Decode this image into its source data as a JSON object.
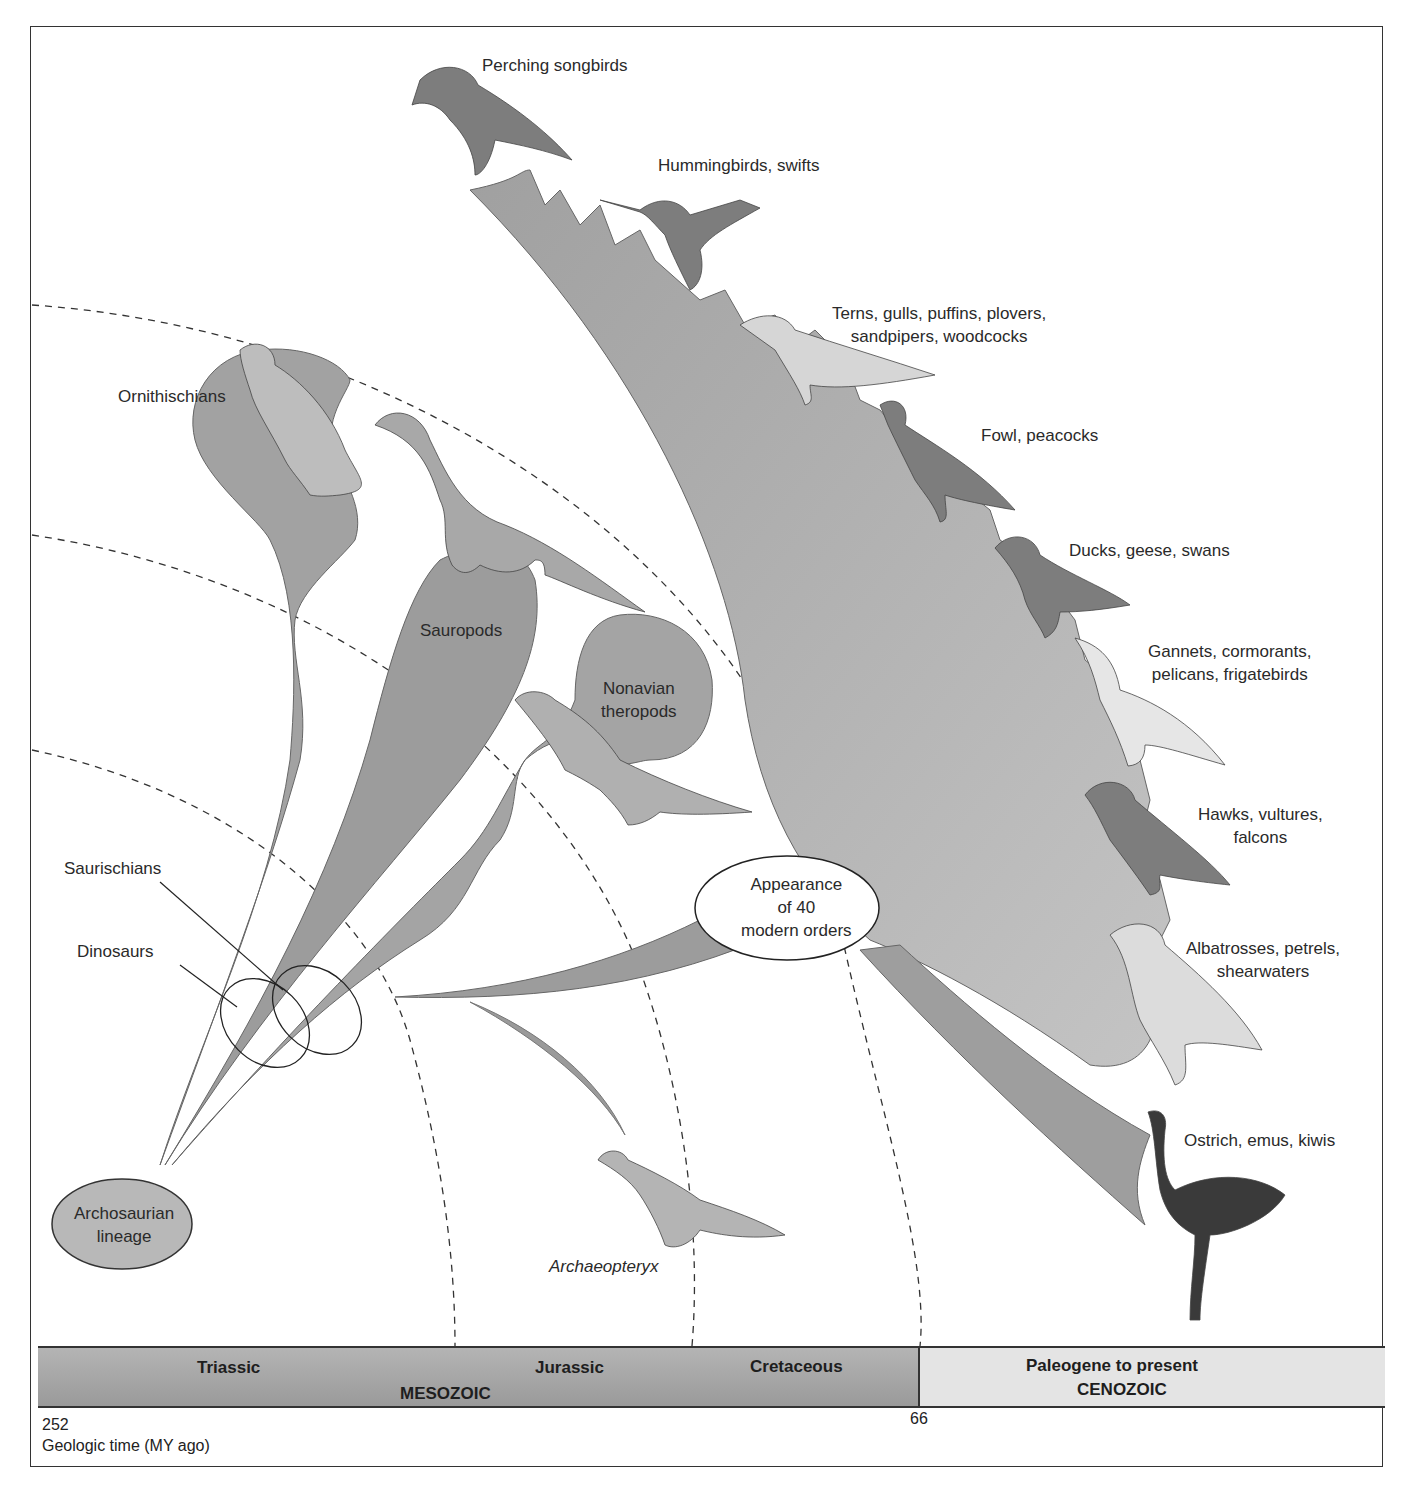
{
  "figure": {
    "colors": {
      "clade_fill": "#9e9e9e",
      "clade_fill_light": "#c2c2c2",
      "mesozoic_bar": "#a8a8a8",
      "cenozoic_bar": "#e4e4e4",
      "frame": "#333333"
    }
  },
  "clades": {
    "archosaurian": "Archosaurian\nlineage",
    "archosaurian_line1": "Archosaurian",
    "archosaurian_line2": "lineage",
    "saurischians": "Saurischians",
    "dinosaurs": "Dinosaurs",
    "ornithischians": "Ornithischians",
    "sauropods": "Sauropods",
    "nonavian_line1": "Nonavian",
    "nonavian_line2": "theropods",
    "archaeopteryx": "Archaeopteryx",
    "radiation_line1": "Appearance",
    "radiation_line2": "of 40",
    "radiation_line3": "modern orders"
  },
  "bird_groups": [
    {
      "line1": "Perching songbirds",
      "line2": ""
    },
    {
      "line1": "Hummingbirds, swifts",
      "line2": ""
    },
    {
      "line1": "Terns, gulls, puffins, plovers,",
      "line2": "sandpipers, woodcocks"
    },
    {
      "line1": "Fowl, peacocks",
      "line2": ""
    },
    {
      "line1": "Ducks, geese, swans",
      "line2": ""
    },
    {
      "line1": "Gannets, cormorants,",
      "line2": "pelicans, frigatebirds"
    },
    {
      "line1": "Hawks, vultures,",
      "line2": "falcons"
    },
    {
      "line1": "Albatrosses, petrels,",
      "line2": "shearwaters"
    },
    {
      "line1": "Ostrich, emus, kiwis",
      "line2": ""
    }
  ],
  "timeline": {
    "periods": [
      "Triassic",
      "Jurassic",
      "Cretaceous",
      "Paleogene to present"
    ],
    "eras": [
      "MESOZOIC",
      "CENOZOIC"
    ],
    "ticks": [
      "252",
      "66"
    ],
    "axis_label": "Geologic time (MY ago)"
  }
}
